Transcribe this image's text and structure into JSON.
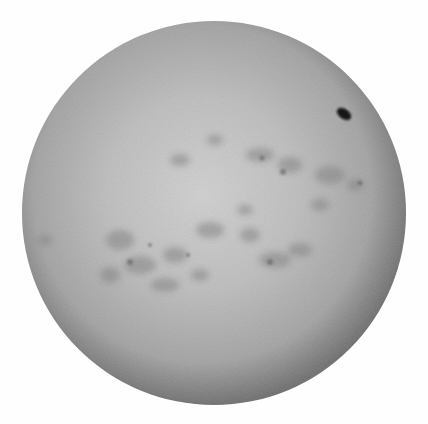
{
  "image": {
    "subject": "solar disk",
    "description": "Grayscale image of the Sun showing limb darkening, mottled plage regions and a dark sunspot near the upper-right limb",
    "background_color": "#ffffff",
    "disk": {
      "cx": 214,
      "cy": 213,
      "r": 192,
      "center_color": "#c8c8c8",
      "limb_color": "#6e6e6e"
    },
    "sunspot": {
      "cx": 344,
      "cy": 114,
      "rx": 8,
      "ry": 5,
      "color": "#151515"
    }
  }
}
